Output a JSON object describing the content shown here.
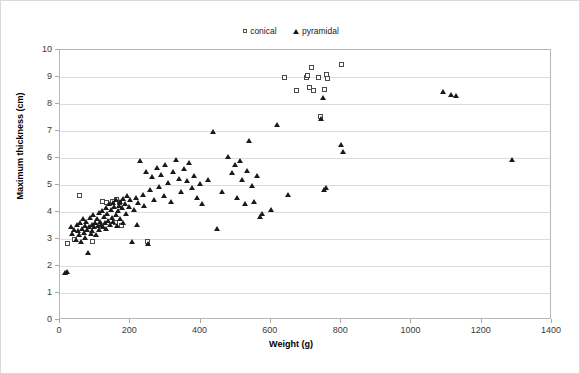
{
  "chart_data": {
    "type": "scatter",
    "title": "",
    "xlabel": "Weight (g)",
    "ylabel": "Maximum thickness (cm)",
    "xlim": [
      0,
      1400
    ],
    "ylim": [
      0,
      10
    ],
    "xticks": [
      0,
      200,
      400,
      600,
      800,
      1000,
      1200,
      1400
    ],
    "yticks": [
      0,
      1,
      2,
      3,
      4,
      5,
      6,
      7,
      8,
      9,
      10
    ],
    "grid": "horizontal",
    "legend_position": "top-center",
    "series": [
      {
        "name": "conical",
        "marker": "open-square",
        "color": "#4a4a4a",
        "points": [
          [
            22,
            2.85
          ],
          [
            40,
            3.0
          ],
          [
            55,
            4.6
          ],
          [
            92,
            2.9
          ],
          [
            120,
            4.4
          ],
          [
            133,
            4.35
          ],
          [
            150,
            4.4
          ],
          [
            158,
            3.6
          ],
          [
            162,
            4.45
          ],
          [
            170,
            4.35
          ],
          [
            175,
            3.5
          ],
          [
            250,
            2.9
          ],
          [
            638,
            9.0
          ],
          [
            672,
            8.5
          ],
          [
            700,
            9.0
          ],
          [
            705,
            9.05
          ],
          [
            710,
            8.6
          ],
          [
            716,
            9.35
          ],
          [
            722,
            8.5
          ],
          [
            735,
            9.0
          ],
          [
            742,
            7.55
          ],
          [
            752,
            8.55
          ],
          [
            758,
            9.1
          ],
          [
            762,
            8.95
          ],
          [
            800,
            9.45
          ]
        ]
      },
      {
        "name": "pyramidal",
        "marker": "filled-triangle",
        "color": "#1a1a1a",
        "points": [
          [
            15,
            1.75
          ],
          [
            20,
            1.8
          ],
          [
            30,
            3.45
          ],
          [
            35,
            3.2
          ],
          [
            40,
            3.35
          ],
          [
            45,
            3.0
          ],
          [
            48,
            3.55
          ],
          [
            52,
            3.3
          ],
          [
            55,
            3.15
          ],
          [
            58,
            3.6
          ],
          [
            60,
            2.9
          ],
          [
            62,
            3.4
          ],
          [
            65,
            3.75
          ],
          [
            68,
            3.25
          ],
          [
            70,
            3.5
          ],
          [
            72,
            3.05
          ],
          [
            75,
            3.65
          ],
          [
            78,
            3.35
          ],
          [
            80,
            2.5
          ],
          [
            82,
            3.45
          ],
          [
            85,
            3.8
          ],
          [
            88,
            3.2
          ],
          [
            90,
            3.55
          ],
          [
            92,
            3.3
          ],
          [
            95,
            3.9
          ],
          [
            98,
            3.45
          ],
          [
            100,
            3.6
          ],
          [
            102,
            3.15
          ],
          [
            105,
            3.75
          ],
          [
            108,
            3.5
          ],
          [
            110,
            4.0
          ],
          [
            112,
            3.35
          ],
          [
            115,
            3.65
          ],
          [
            118,
            3.55
          ],
          [
            120,
            4.05
          ],
          [
            122,
            3.45
          ],
          [
            125,
            3.85
          ],
          [
            128,
            3.6
          ],
          [
            130,
            4.15
          ],
          [
            132,
            3.4
          ],
          [
            135,
            3.95
          ],
          [
            138,
            3.7
          ],
          [
            140,
            4.3
          ],
          [
            142,
            3.55
          ],
          [
            145,
            4.1
          ],
          [
            148,
            3.8
          ],
          [
            150,
            4.35
          ],
          [
            152,
            3.65
          ],
          [
            155,
            4.2
          ],
          [
            158,
            3.9
          ],
          [
            160,
            4.45
          ],
          [
            162,
            3.5
          ],
          [
            165,
            4.05
          ],
          [
            168,
            4.25
          ],
          [
            170,
            3.75
          ],
          [
            172,
            4.4
          ],
          [
            175,
            4.15
          ],
          [
            178,
            3.6
          ],
          [
            180,
            4.5
          ],
          [
            185,
            4.3
          ],
          [
            188,
            3.95
          ],
          [
            190,
            4.6
          ],
          [
            195,
            4.2
          ],
          [
            200,
            4.45
          ],
          [
            205,
            2.9
          ],
          [
            210,
            4.1
          ],
          [
            215,
            4.55
          ],
          [
            218,
            3.55
          ],
          [
            222,
            4.35
          ],
          [
            228,
            5.9
          ],
          [
            235,
            4.65
          ],
          [
            240,
            4.25
          ],
          [
            245,
            5.5
          ],
          [
            250,
            2.85
          ],
          [
            255,
            4.85
          ],
          [
            262,
            5.3
          ],
          [
            268,
            4.45
          ],
          [
            275,
            5.65
          ],
          [
            282,
            4.95
          ],
          [
            288,
            5.4
          ],
          [
            295,
            4.6
          ],
          [
            300,
            5.75
          ],
          [
            308,
            5.1
          ],
          [
            315,
            4.4
          ],
          [
            322,
            5.5
          ],
          [
            330,
            5.95
          ],
          [
            338,
            5.25
          ],
          [
            345,
            4.75
          ],
          [
            352,
            5.6
          ],
          [
            360,
            5.15
          ],
          [
            368,
            5.85
          ],
          [
            375,
            4.9
          ],
          [
            382,
            5.35
          ],
          [
            390,
            4.55
          ],
          [
            398,
            5.05
          ],
          [
            405,
            4.3
          ],
          [
            420,
            5.2
          ],
          [
            435,
            7.0
          ],
          [
            448,
            3.4
          ],
          [
            462,
            4.75
          ],
          [
            478,
            6.05
          ],
          [
            490,
            5.45
          ],
          [
            498,
            5.75
          ],
          [
            505,
            4.55
          ],
          [
            512,
            5.9
          ],
          [
            518,
            5.2
          ],
          [
            525,
            4.3
          ],
          [
            532,
            5.55
          ],
          [
            538,
            6.65
          ],
          [
            545,
            5.0
          ],
          [
            552,
            4.4
          ],
          [
            560,
            5.35
          ],
          [
            568,
            3.85
          ],
          [
            575,
            3.95
          ],
          [
            600,
            4.1
          ],
          [
            618,
            7.25
          ],
          [
            648,
            4.65
          ],
          [
            742,
            7.45
          ],
          [
            748,
            8.25
          ],
          [
            752,
            4.85
          ],
          [
            758,
            4.9
          ],
          [
            800,
            6.5
          ],
          [
            805,
            6.25
          ],
          [
            1090,
            8.45
          ],
          [
            1112,
            8.35
          ],
          [
            1128,
            8.3
          ],
          [
            1285,
            5.95
          ]
        ]
      }
    ]
  },
  "legend": {
    "entries": [
      {
        "label": "conical"
      },
      {
        "label": "pyramidal"
      }
    ]
  },
  "axes": {
    "x_title": "Weight (g)",
    "y_title": "Maximum thickness (cm)",
    "x_tick_labels": [
      "0",
      "200",
      "400",
      "600",
      "800",
      "1000",
      "1200",
      "1400"
    ],
    "y_tick_labels": [
      "0",
      "1",
      "2",
      "3",
      "4",
      "5",
      "6",
      "7",
      "8",
      "9",
      "10"
    ]
  }
}
